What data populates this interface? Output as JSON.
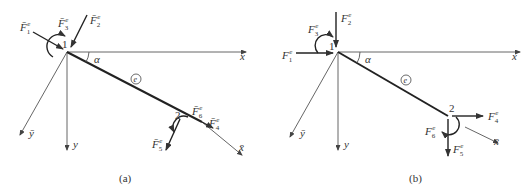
{
  "figure": {
    "panels": [
      {
        "id": "a",
        "caption": "(a)",
        "node1_label": "1",
        "node2_label": "2",
        "angle_label": "α",
        "element_label": "e",
        "axes": {
          "x": "x",
          "y": "y",
          "x_local": "x̄",
          "y_local": "ȳ"
        },
        "forces": {
          "F1": {
            "base": "F̄",
            "sub": "1",
            "sup": "e"
          },
          "F2": {
            "base": "F̄",
            "sub": "2",
            "sup": "e"
          },
          "F3": {
            "base": "F̄",
            "sub": "3",
            "sup": "e"
          },
          "F4": {
            "base": "F̄",
            "sub": "4",
            "sup": "e"
          },
          "F5": {
            "base": "F̄",
            "sub": "5",
            "sup": "e"
          },
          "F6": {
            "base": "F̄",
            "sub": "6",
            "sup": "e"
          }
        }
      },
      {
        "id": "b",
        "caption": "(b)",
        "node1_label": "1",
        "node2_label": "2",
        "angle_label": "α",
        "element_label": "e",
        "axes": {
          "x": "x",
          "y": "y",
          "x_local": "x̄",
          "y_local": "ȳ"
        },
        "forces": {
          "F1": {
            "base": "F",
            "sub": "1",
            "sup": "e"
          },
          "F2": {
            "base": "F",
            "sub": "2",
            "sup": "e"
          },
          "F3": {
            "base": "F",
            "sub": "3",
            "sup": "e"
          },
          "F4": {
            "base": "F",
            "sub": "4",
            "sup": "e"
          },
          "F5": {
            "base": "F",
            "sub": "5",
            "sup": "e"
          },
          "F6": {
            "base": "F",
            "sub": "6",
            "sup": "e"
          }
        }
      }
    ]
  }
}
